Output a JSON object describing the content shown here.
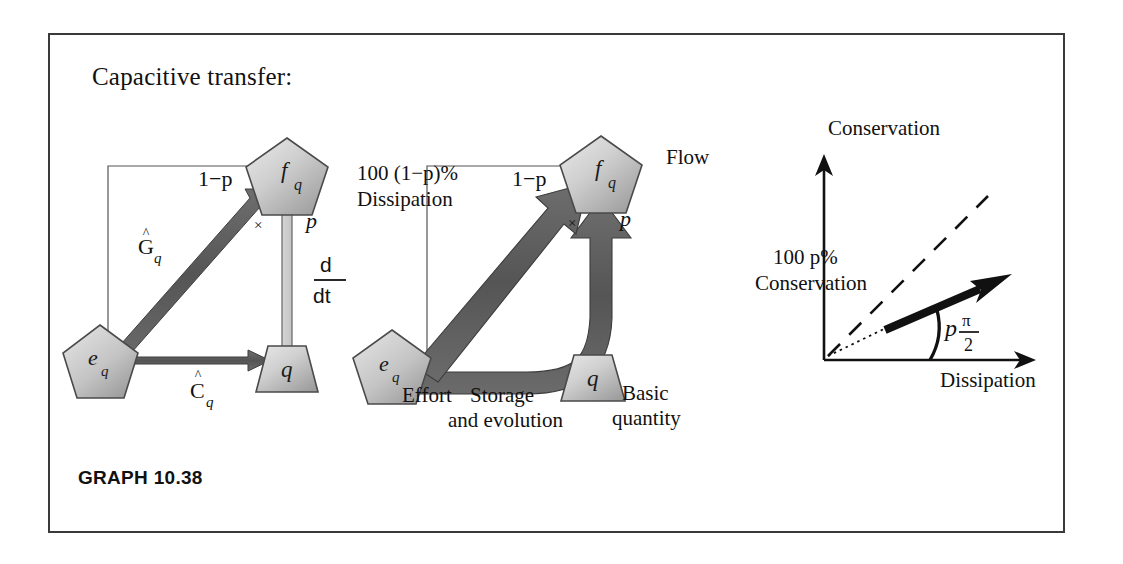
{
  "figure": {
    "title": "Capacitive transfer:",
    "caption": "GRAPH 10.38"
  },
  "panels": {
    "left": {
      "name": "bond-graph-capacitive-transfer",
      "nodes": {
        "flow": "f",
        "flow_sub": "q",
        "effort": "e",
        "effort_sub": "q",
        "quantity": "q"
      },
      "edges": {
        "conductance_label": "G",
        "conductance_sub": "q",
        "capacitance_label": "C",
        "capacitance_sub": "q",
        "derivative_num": "d",
        "derivative_den": "dt"
      },
      "weights": {
        "dissipative": "1−p",
        "conservative": "p",
        "cross": "×"
      }
    },
    "middle": {
      "name": "capacitive-transfer-flow-widths",
      "nodes": {
        "flow": "f",
        "flow_sub": "q",
        "effort": "e",
        "effort_sub": "q",
        "quantity": "q"
      },
      "weights": {
        "dissipative": "1−p",
        "conservative": "p",
        "cross": "×"
      },
      "annotations": {
        "dissipation_line1": "100 (1−p)%",
        "dissipation_line2": "Dissipation",
        "flow": "Flow",
        "effort": "Effort",
        "storage_line1": "Storage",
        "storage_line2": "and evolution",
        "quantity_line1": "Basic",
        "quantity_line2": "quantity"
      }
    },
    "right": {
      "name": "conservation-dissipation-angle-plot",
      "axes": {
        "y_label": "Conservation",
        "x_label": "Dissipation"
      },
      "annotations": {
        "conservation_line1": "100 p%",
        "conservation_line2": "Conservation",
        "angle_p": "p",
        "angle_num": "π",
        "angle_den": "2"
      }
    }
  },
  "colors": {
    "frame_border": "#3a3a3a",
    "arrow_dark": "#585858",
    "arrow_light": "#c9c9c9",
    "node_fill_light": "#d7d7d7",
    "node_fill_dark": "#a8a8a8",
    "ink": "#111111",
    "thin_rule": "#555555",
    "background": "#ffffff"
  }
}
